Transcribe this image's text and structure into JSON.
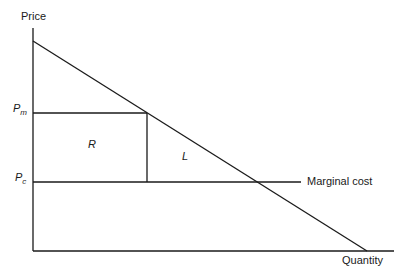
{
  "diagram": {
    "axes": {
      "y_label": "Price",
      "x_label": "Quantity"
    },
    "price_levels": {
      "monopoly": {
        "symbol": "P",
        "subscript": "m"
      },
      "competitive": {
        "symbol": "P",
        "subscript": "c"
      }
    },
    "regions": {
      "rectangle": "R",
      "triangle": "L"
    },
    "curves": {
      "marginal_cost": "Marginal cost",
      "demand": ""
    },
    "colors": {
      "line": "#1a1a1a",
      "background": "#ffffff"
    }
  }
}
